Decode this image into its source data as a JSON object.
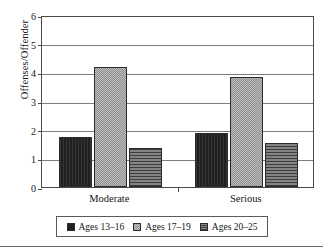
{
  "chart_data": {
    "type": "bar",
    "title": "",
    "xlabel": "",
    "ylabel": "Offenses/Offender",
    "categories": [
      "Moderate",
      "Serious"
    ],
    "series": [
      {
        "name": "Ages 13–16",
        "values": [
          1.75,
          1.9
        ],
        "color": "#211f1f",
        "pattern": "solid-dark"
      },
      {
        "name": "Ages 17–19",
        "values": [
          4.2,
          3.85
        ],
        "color": "#a9a9a9",
        "pattern": "stipple-light"
      },
      {
        "name": "Ages 20–25",
        "values": [
          1.35,
          1.55
        ],
        "color": "#696969",
        "pattern": "horizontal-hatch"
      }
    ],
    "ylim": [
      0,
      6
    ],
    "yticks": [
      0,
      1,
      2,
      3,
      4,
      5,
      6
    ],
    "ytick_labels": [
      "0",
      "1",
      "2",
      "3",
      "4",
      "5",
      "6"
    ],
    "grid": true,
    "grid_axis": "y",
    "legend_position": "bottom",
    "legend_entries": [
      "Ages 13–16",
      "Ages 17–19",
      "Ages 20–25"
    ]
  }
}
